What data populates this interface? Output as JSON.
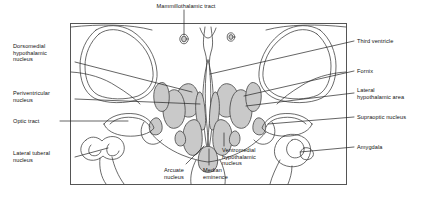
{
  "figure": {
    "type": "anatomical-diagram",
    "frame": {
      "x": 70,
      "y": 23,
      "width": 277,
      "height": 162
    },
    "colors": {
      "nucleus_fill": "#c9c9c9",
      "outline": "#3a3a3a",
      "frame": "#555555",
      "leader_line": "#222222",
      "background": "#ffffff",
      "text": "#111111"
    },
    "labels": [
      {
        "id": "mammillothalamic-tract",
        "text": "Mammillothalamic tract",
        "side": "top",
        "x": 155,
        "y": 3,
        "align": "center"
      },
      {
        "id": "dorsomedial-hypothalamic-nucleus",
        "text": "Dorsomedial\nhypothalamic\nnucleus",
        "side": "left",
        "x": 13,
        "y": 43,
        "align": "left"
      },
      {
        "id": "periventricular-nucleus",
        "text": "Periventricular\nnucleus",
        "side": "left",
        "x": 13,
        "y": 90,
        "align": "left"
      },
      {
        "id": "optic-tract",
        "text": "Optic tract",
        "side": "left",
        "x": 13,
        "y": 118,
        "align": "left"
      },
      {
        "id": "lateral-tuberal-nucleus",
        "text": "Lateral tuberal\nnucleus",
        "side": "left",
        "x": 13,
        "y": 150,
        "align": "left"
      },
      {
        "id": "third-ventricle",
        "text": "Third ventricle",
        "side": "right",
        "x": 356,
        "y": 39,
        "align": "left"
      },
      {
        "id": "fornix",
        "text": "Fornix",
        "side": "right",
        "x": 356,
        "y": 69,
        "align": "left"
      },
      {
        "id": "lateral-hypothalamic-area",
        "text": "Lateral\nhypothalamic area",
        "side": "right",
        "x": 356,
        "y": 89,
        "align": "left"
      },
      {
        "id": "supraoptic-nucleus",
        "text": "Supraoptic nucleus",
        "side": "right",
        "x": 356,
        "y": 115,
        "align": "left"
      },
      {
        "id": "amygdala",
        "text": "Amygdala",
        "side": "right",
        "x": 356,
        "y": 145,
        "align": "left"
      },
      {
        "id": "arcuate-nucleus",
        "text": "Arcuate\nnucleus",
        "side": "bottom",
        "x": 166,
        "y": 168,
        "align": "left"
      },
      {
        "id": "median-eminence",
        "text": "Median\neminence",
        "side": "bottom",
        "x": 202,
        "y": 168,
        "align": "left"
      },
      {
        "id": "ventromedial-hypothalamic-nucleus",
        "text": "Ventromedial\nhypothalamic\nnucleus",
        "side": "bottom",
        "x": 222,
        "y": 148,
        "align": "left"
      }
    ]
  }
}
